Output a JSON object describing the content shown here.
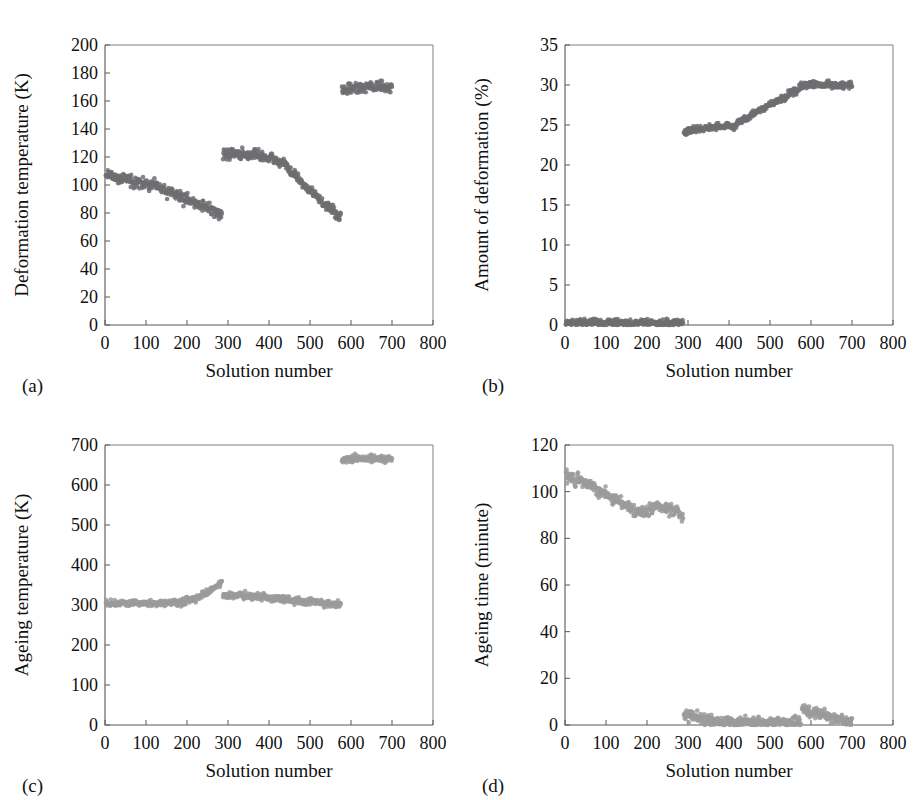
{
  "figure": {
    "panels": [
      {
        "tag": "(a)",
        "xlabel": "Solution number",
        "ylabel": "Deformation temperature (K)",
        "xlim": [
          0,
          800
        ],
        "ylim": [
          0,
          200
        ],
        "xticks": [
          0,
          100,
          200,
          300,
          400,
          500,
          600,
          700,
          800
        ],
        "yticks": [
          0,
          20,
          40,
          60,
          80,
          100,
          120,
          140,
          160,
          180,
          200
        ],
        "marker_color": "#6f6f72",
        "marker_size": 2.3,
        "noise": 2.6,
        "segments": [
          {
            "x0": 2,
            "x1": 285,
            "pts": 285,
            "knots": [
              [
                2,
                107
              ],
              [
                40,
                105
              ],
              [
                80,
                102
              ],
              [
                120,
                99
              ],
              [
                160,
                95
              ],
              [
                200,
                90
              ],
              [
                240,
                85
              ],
              [
                285,
                79
              ]
            ]
          },
          {
            "x0": 288,
            "x1": 575,
            "pts": 290,
            "knots": [
              [
                288,
                121
              ],
              [
                310,
                123
              ],
              [
                340,
                121
              ],
              [
                370,
                122
              ],
              [
                400,
                119
              ],
              [
                430,
                117
              ],
              [
                460,
                108
              ],
              [
                500,
                96
              ],
              [
                540,
                85
              ],
              [
                575,
                77
              ]
            ]
          },
          {
            "x0": 578,
            "x1": 700,
            "pts": 125,
            "knots": [
              [
                578,
                168
              ],
              [
                600,
                169
              ],
              [
                640,
                170
              ],
              [
                670,
                170
              ],
              [
                700,
                170
              ]
            ]
          }
        ]
      },
      {
        "tag": "(b)",
        "xlabel": "Solution number",
        "ylabel": "Amount of deformation (%)",
        "xlim": [
          0,
          800
        ],
        "ylim": [
          0,
          35
        ],
        "xticks": [
          0,
          100,
          200,
          300,
          400,
          500,
          600,
          700,
          800
        ],
        "yticks": [
          0,
          5,
          10,
          15,
          20,
          25,
          30,
          35
        ],
        "marker_color": "#6f6f72",
        "marker_size": 2.3,
        "noise": 0.3,
        "segments": [
          {
            "x0": 2,
            "x1": 288,
            "pts": 290,
            "knots": [
              [
                2,
                0.3
              ],
              [
                100,
                0.3
              ],
              [
                200,
                0.3
              ],
              [
                288,
                0.3
              ]
            ]
          },
          {
            "x0": 290,
            "x1": 585,
            "pts": 300,
            "knots": [
              [
                290,
                24.2
              ],
              [
                320,
                24.5
              ],
              [
                350,
                24.7
              ],
              [
                380,
                24.8
              ],
              [
                410,
                24.9
              ],
              [
                440,
                25.8
              ],
              [
                470,
                26.7
              ],
              [
                500,
                27.5
              ],
              [
                530,
                28.3
              ],
              [
                560,
                29.2
              ],
              [
                585,
                30.2
              ]
            ]
          },
          {
            "x0": 588,
            "x1": 700,
            "pts": 115,
            "knots": [
              [
                588,
                30.1
              ],
              [
                620,
                30.0
              ],
              [
                660,
                30.0
              ],
              [
                700,
                30.0
              ]
            ]
          }
        ]
      },
      {
        "tag": "(c)",
        "xlabel": "Solution number",
        "ylabel": "Ageing temperature (K)",
        "xlim": [
          0,
          800
        ],
        "ylim": [
          0,
          700
        ],
        "xticks": [
          0,
          100,
          200,
          300,
          400,
          500,
          600,
          700,
          800
        ],
        "yticks": [
          0,
          100,
          200,
          300,
          400,
          500,
          600,
          700
        ],
        "marker_color": "#9b9b9e",
        "marker_size": 2.3,
        "noise": 6.0,
        "segments": [
          {
            "x0": 2,
            "x1": 285,
            "pts": 285,
            "knots": [
              [
                2,
                303
              ],
              [
                60,
                303
              ],
              [
                120,
                304
              ],
              [
                180,
                306
              ],
              [
                210,
                312
              ],
              [
                240,
                325
              ],
              [
                265,
                342
              ],
              [
                285,
                354
              ]
            ]
          },
          {
            "x0": 288,
            "x1": 575,
            "pts": 290,
            "knots": [
              [
                288,
                324
              ],
              [
                320,
                325
              ],
              [
                350,
                322
              ],
              [
                380,
                320
              ],
              [
                420,
                316
              ],
              [
                460,
                312
              ],
              [
                500,
                308
              ],
              [
                540,
                304
              ],
              [
                575,
                301
              ]
            ]
          },
          {
            "x0": 578,
            "x1": 700,
            "pts": 120,
            "knots": [
              [
                578,
                664
              ],
              [
                610,
                666
              ],
              [
                650,
                666
              ],
              [
                680,
                665
              ],
              [
                700,
                664
              ]
            ]
          }
        ]
      },
      {
        "tag": "(d)",
        "xlabel": "Solution number",
        "ylabel": "Ageing time (minute)",
        "xlim": [
          0,
          800
        ],
        "ylim": [
          0,
          120
        ],
        "xticks": [
          0,
          100,
          200,
          300,
          400,
          500,
          600,
          700,
          800
        ],
        "yticks": [
          0,
          20,
          40,
          60,
          80,
          100,
          120
        ],
        "marker_color": "#9b9b9e",
        "marker_size": 2.3,
        "noise": 1.7,
        "segments": [
          {
            "x0": 2,
            "x1": 288,
            "pts": 290,
            "knots": [
              [
                2,
                107
              ],
              [
                30,
                105
              ],
              [
                60,
                103
              ],
              [
                90,
                100
              ],
              [
                120,
                97
              ],
              [
                150,
                94
              ],
              [
                175,
                91
              ],
              [
                200,
                92
              ],
              [
                225,
                94
              ],
              [
                250,
                92
              ],
              [
                270,
                92
              ],
              [
                288,
                89
              ]
            ]
          },
          {
            "x0": 290,
            "x1": 575,
            "pts": 290,
            "knots": [
              [
                290,
                5.0
              ],
              [
                310,
                4.0
              ],
              [
                330,
                3.0
              ],
              [
                350,
                2.0
              ],
              [
                370,
                1.4
              ],
              [
                420,
                1.2
              ],
              [
                480,
                1.2
              ],
              [
                530,
                1.1
              ],
              [
                575,
                1.0
              ]
            ]
          },
          {
            "x0": 578,
            "x1": 700,
            "pts": 125,
            "knots": [
              [
                578,
                7.0
              ],
              [
                600,
                5.5
              ],
              [
                630,
                4.0
              ],
              [
                660,
                2.5
              ],
              [
                700,
                0.8
              ]
            ]
          }
        ]
      }
    ]
  },
  "chart_data": [
    {
      "type": "scatter",
      "panel": "(a)",
      "title": "",
      "xlabel": "Solution number",
      "ylabel": "Deformation temperature (K)",
      "xlim": [
        0,
        800
      ],
      "ylim": [
        0,
        200
      ],
      "xticks": [
        0,
        100,
        200,
        300,
        400,
        500,
        600,
        700,
        800
      ],
      "yticks": [
        0,
        20,
        40,
        60,
        80,
        100,
        120,
        140,
        160,
        180,
        200
      ],
      "grid": false,
      "legend": "none",
      "series": [
        {
          "name": "band-1",
          "x_range": [
            0,
            285
          ],
          "y_from": 107,
          "y_to": 79,
          "x": [
            0,
            40,
            80,
            120,
            160,
            200,
            240,
            285
          ],
          "values": [
            107,
            105,
            102,
            99,
            95,
            90,
            85,
            79
          ]
        },
        {
          "name": "band-2",
          "x_range": [
            288,
            575
          ],
          "y_from": 121,
          "y_to": 77,
          "x": [
            288,
            310,
            340,
            370,
            400,
            430,
            460,
            500,
            540,
            575
          ],
          "values": [
            121,
            123,
            121,
            122,
            119,
            117,
            108,
            96,
            85,
            77
          ]
        },
        {
          "name": "band-3",
          "x_range": [
            578,
            700
          ],
          "y_from": 168,
          "y_to": 170,
          "x": [
            578,
            600,
            640,
            670,
            700
          ],
          "values": [
            168,
            169,
            170,
            170,
            170
          ]
        }
      ]
    },
    {
      "type": "scatter",
      "panel": "(b)",
      "title": "",
      "xlabel": "Solution number",
      "ylabel": "Amount of deformation (%)",
      "xlim": [
        0,
        800
      ],
      "ylim": [
        0,
        35
      ],
      "xticks": [
        0,
        100,
        200,
        300,
        400,
        500,
        600,
        700,
        800
      ],
      "yticks": [
        0,
        5,
        10,
        15,
        20,
        25,
        30,
        35
      ],
      "grid": false,
      "legend": "none",
      "series": [
        {
          "name": "zero-band",
          "x_range": [
            0,
            288
          ],
          "y_from": 0,
          "y_to": 0,
          "x": [
            0,
            100,
            200,
            288
          ],
          "values": [
            0,
            0,
            0,
            0
          ]
        },
        {
          "name": "rising-band",
          "x_range": [
            290,
            585
          ],
          "y_from": 24.2,
          "y_to": 30.2,
          "x": [
            290,
            320,
            350,
            380,
            410,
            440,
            470,
            500,
            530,
            560,
            585
          ],
          "values": [
            24.2,
            24.5,
            24.7,
            24.8,
            24.9,
            25.8,
            26.7,
            27.5,
            28.3,
            29.2,
            30.2
          ]
        },
        {
          "name": "plateau-band",
          "x_range": [
            588,
            700
          ],
          "y_from": 30.1,
          "y_to": 30.0,
          "x": [
            588,
            620,
            660,
            700
          ],
          "values": [
            30.1,
            30.0,
            30.0,
            30.0
          ]
        }
      ]
    },
    {
      "type": "scatter",
      "panel": "(c)",
      "title": "",
      "xlabel": "Solution number",
      "ylabel": "Ageing temperature (K)",
      "xlim": [
        0,
        800
      ],
      "ylim": [
        0,
        700
      ],
      "xticks": [
        0,
        100,
        200,
        300,
        400,
        500,
        600,
        700,
        800
      ],
      "yticks": [
        0,
        100,
        200,
        300,
        400,
        500,
        600,
        700
      ],
      "grid": false,
      "legend": "none",
      "series": [
        {
          "name": "band-1",
          "x_range": [
            0,
            285
          ],
          "y_from": 303,
          "y_to": 354,
          "x": [
            0,
            60,
            120,
            180,
            210,
            240,
            265,
            285
          ],
          "values": [
            303,
            303,
            304,
            306,
            312,
            325,
            342,
            354
          ]
        },
        {
          "name": "band-2",
          "x_range": [
            288,
            575
          ],
          "y_from": 324,
          "y_to": 301,
          "x": [
            288,
            320,
            350,
            380,
            420,
            460,
            500,
            540,
            575
          ],
          "values": [
            324,
            325,
            322,
            320,
            316,
            312,
            308,
            304,
            301
          ]
        },
        {
          "name": "band-3",
          "x_range": [
            578,
            700
          ],
          "y_from": 664,
          "y_to": 664,
          "x": [
            578,
            610,
            650,
            680,
            700
          ],
          "values": [
            664,
            666,
            666,
            665,
            664
          ]
        }
      ]
    },
    {
      "type": "scatter",
      "panel": "(d)",
      "title": "",
      "xlabel": "Solution number",
      "ylabel": "Ageing time (minute)",
      "xlim": [
        0,
        800
      ],
      "ylim": [
        0,
        120
      ],
      "xticks": [
        0,
        100,
        200,
        300,
        400,
        500,
        600,
        700,
        800
      ],
      "yticks": [
        0,
        20,
        40,
        60,
        80,
        100,
        120
      ],
      "grid": false,
      "legend": "none",
      "series": [
        {
          "name": "band-1",
          "x_range": [
            0,
            288
          ],
          "y_from": 107,
          "y_to": 89,
          "x": [
            0,
            30,
            60,
            90,
            120,
            150,
            175,
            200,
            225,
            250,
            270,
            288
          ],
          "values": [
            107,
            105,
            103,
            100,
            97,
            94,
            91,
            92,
            94,
            92,
            92,
            89
          ]
        },
        {
          "name": "band-2",
          "x_range": [
            290,
            575
          ],
          "y_from": 5.0,
          "y_to": 1.0,
          "x": [
            290,
            310,
            330,
            350,
            370,
            420,
            480,
            530,
            575
          ],
          "values": [
            5.0,
            4.0,
            3.0,
            2.0,
            1.4,
            1.2,
            1.2,
            1.1,
            1.0
          ]
        },
        {
          "name": "band-3",
          "x_range": [
            578,
            700
          ],
          "y_from": 7.0,
          "y_to": 0.8,
          "x": [
            578,
            600,
            630,
            660,
            700
          ],
          "values": [
            7.0,
            5.5,
            4.0,
            2.5,
            0.8
          ]
        }
      ]
    }
  ]
}
